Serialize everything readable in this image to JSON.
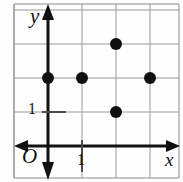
{
  "figure": {
    "kind": "coordinate-grid-scatter",
    "axis_labels": {
      "x": "x",
      "y": "y",
      "origin": "O"
    },
    "tick_labels": {
      "x_unit": "1",
      "y_unit": "1"
    },
    "colors": {
      "background": "#fefefe",
      "grid": "#9a9a9a",
      "axis": "#111111",
      "point": "#101010",
      "border": "#8c8c8c"
    }
  },
  "chart_data": {
    "type": "scatter",
    "title": "",
    "xlabel": "x",
    "ylabel": "y",
    "x": [
      0,
      1,
      3,
      2,
      2
    ],
    "y": [
      2,
      2,
      2,
      3,
      1
    ],
    "points": [
      {
        "x": 0,
        "y": 2
      },
      {
        "x": 1,
        "y": 2
      },
      {
        "x": 3,
        "y": 2
      },
      {
        "x": 2,
        "y": 3
      },
      {
        "x": 2,
        "y": 1
      }
    ],
    "xlim": [
      -1,
      4
    ],
    "ylim": [
      -1,
      4
    ],
    "xticks": [
      1
    ],
    "yticks": [
      1
    ],
    "xtick_labels": [
      "1"
    ],
    "ytick_labels": [
      "1"
    ],
    "grid": true,
    "grid_spacing": 1,
    "legend": null,
    "marker": "filled-circle",
    "marker_size": 6
  },
  "geometry": {
    "origin_px": {
      "x": 48,
      "y": 146
    },
    "unit_px": 34,
    "grid_x_px": [
      14,
      48,
      82,
      116,
      150
    ],
    "grid_y_px": [
      10,
      38,
      78,
      112,
      146
    ],
    "frame_px": {
      "left": 14,
      "top": 4,
      "right": 179,
      "bottom": 178
    }
  }
}
